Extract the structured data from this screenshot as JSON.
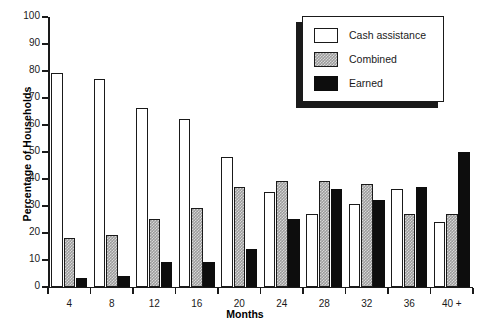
{
  "chart_data": {
    "type": "bar",
    "title": "",
    "xlabel": "Months",
    "ylabel": "Percentage of Households",
    "categories": [
      "4",
      "8",
      "12",
      "16",
      "20",
      "24",
      "28",
      "32",
      "36",
      "40 +"
    ],
    "series": [
      {
        "name": "Cash assistance",
        "color": "#ffffff",
        "fill": "open",
        "values": [
          79,
          77,
          66,
          62,
          48,
          35,
          27,
          30.5,
          36,
          24
        ]
      },
      {
        "name": "Combined",
        "color": "#9c9c9c",
        "fill": "checkered",
        "values": [
          18,
          19,
          25,
          29,
          37,
          39,
          39,
          38,
          27,
          27
        ]
      },
      {
        "name": "Earned",
        "color": "#0d0d0d",
        "fill": "solid",
        "values": [
          3,
          4,
          9,
          9,
          14,
          25,
          36,
          32,
          37,
          50
        ]
      }
    ],
    "ylim": [
      0,
      100
    ],
    "yticks": [
      0,
      10,
      20,
      30,
      40,
      50,
      60,
      70,
      80,
      90,
      100
    ],
    "ytick_labels": [
      "0",
      "10",
      "20",
      "30",
      "40",
      "50",
      "60",
      "70",
      "80",
      "90",
      "100"
    ],
    "grid": false,
    "legend_position": "top-right",
    "legend_entries": [
      "Cash assistance",
      "Combined",
      "Earned"
    ]
  }
}
